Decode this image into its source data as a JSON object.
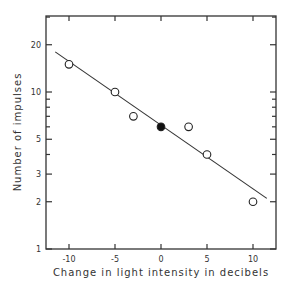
{
  "chart_data": {
    "type": "scatter",
    "title": "",
    "xlabel": "Change in light intensity in decibels",
    "ylabel": "Number of impulses",
    "xlim": [
      -12.5,
      12.5
    ],
    "ylim": [
      1,
      30
    ],
    "yscale": "log",
    "grid": false,
    "x_ticks": [
      -10,
      -5,
      0,
      5,
      10
    ],
    "x_tick_labels": [
      "-10",
      "-5",
      "0",
      "5",
      "10"
    ],
    "y_ticks": [
      1,
      2,
      3,
      5,
      10,
      20
    ],
    "y_tick_labels": [
      "1",
      "2",
      "3",
      "5",
      "10",
      "20"
    ],
    "series": [
      {
        "name": "Observed (open circles)",
        "marker": "open-circle",
        "points": [
          {
            "x": -10,
            "y": 15
          },
          {
            "x": -5,
            "y": 10
          },
          {
            "x": -3,
            "y": 7
          },
          {
            "x": 3,
            "y": 6
          },
          {
            "x": 5,
            "y": 4
          },
          {
            "x": 10,
            "y": 2
          }
        ]
      },
      {
        "name": "Reference (filled circle)",
        "marker": "filled-circle",
        "points": [
          {
            "x": 0,
            "y": 6
          }
        ]
      },
      {
        "name": "Fitted line",
        "marker": "line",
        "points": [
          {
            "x": -11.5,
            "y": 18
          },
          {
            "x": 11.5,
            "y": 2.1
          }
        ]
      }
    ]
  }
}
